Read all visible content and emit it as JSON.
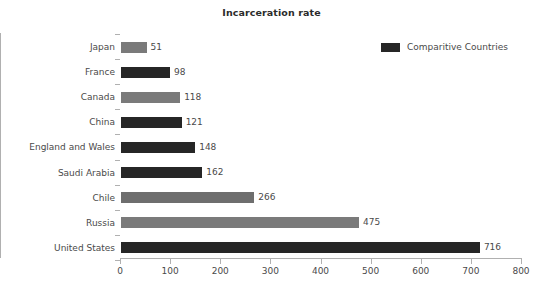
{
  "chart_data": {
    "type": "bar",
    "orientation": "horizontal",
    "title": "Incarceration rate",
    "xlabel": "",
    "ylabel": "",
    "xlim": [
      0,
      800
    ],
    "xticks": [
      0,
      100,
      200,
      300,
      400,
      500,
      600,
      700,
      800
    ],
    "grid": false,
    "legend": {
      "position": "top-right",
      "entries": [
        {
          "label": "Comparitive Countries",
          "color": "#262626"
        }
      ]
    },
    "categories": [
      "Japan",
      "France",
      "Canada",
      "China",
      "England and Wales",
      "Saudi Arabia",
      "Chile",
      "Russia",
      "United States"
    ],
    "values": [
      51,
      98,
      118,
      121,
      148,
      162,
      266,
      475,
      716
    ],
    "bar_colors": [
      "#7a7a7a",
      "#262626",
      "#7a7a7a",
      "#262626",
      "#262626",
      "#262626",
      "#6e6e6e",
      "#7a7a7a",
      "#262626"
    ],
    "series": [
      {
        "name": "Comparitive Countries",
        "values": [
          51,
          98,
          118,
          121,
          148,
          162,
          266,
          475,
          716
        ]
      }
    ]
  },
  "axis": {
    "tick_labels": [
      "0",
      "100",
      "200",
      "300",
      "400",
      "500",
      "600",
      "700",
      "800"
    ]
  },
  "labels": {
    "values": [
      "51",
      "98",
      "118",
      "121",
      "148",
      "162",
      "266",
      "475",
      "716"
    ]
  },
  "colors": {
    "dark_bar": "#262626",
    "gray_bar": "#7a7a7a",
    "axis": "#b0b0b0",
    "text": "#4a4a4a",
    "background": "#ffffff"
  }
}
